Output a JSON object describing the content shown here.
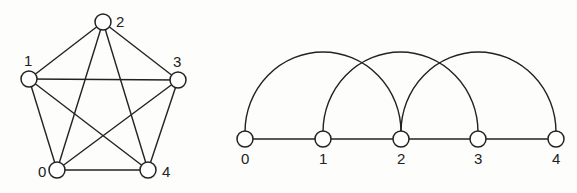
{
  "left_graph": {
    "name": "complete-graph-k5",
    "nodes": [
      {
        "id": "0",
        "label": "0",
        "x": 57,
        "y": 170,
        "lx": 38,
        "ly": 177
      },
      {
        "id": "1",
        "label": "1",
        "x": 29,
        "y": 79,
        "lx": 24,
        "ly": 66
      },
      {
        "id": "2",
        "label": "2",
        "x": 103,
        "y": 22,
        "lx": 116,
        "ly": 27
      },
      {
        "id": "3",
        "label": "3",
        "x": 178,
        "y": 80,
        "lx": 173,
        "ly": 67
      },
      {
        "id": "4",
        "label": "4",
        "x": 148,
        "y": 170,
        "lx": 162,
        "ly": 177
      }
    ],
    "edges": [
      [
        "0",
        "1"
      ],
      [
        "0",
        "2"
      ],
      [
        "0",
        "3"
      ],
      [
        "0",
        "4"
      ],
      [
        "1",
        "2"
      ],
      [
        "1",
        "3"
      ],
      [
        "1",
        "4"
      ],
      [
        "2",
        "3"
      ],
      [
        "2",
        "4"
      ],
      [
        "3",
        "4"
      ]
    ]
  },
  "right_graph": {
    "name": "linear-arc-layout",
    "nodes": [
      {
        "id": "0",
        "label": "0",
        "x": 245,
        "y": 139
      },
      {
        "id": "1",
        "label": "1",
        "x": 323,
        "y": 139
      },
      {
        "id": "2",
        "label": "2",
        "x": 401,
        "y": 139
      },
      {
        "id": "3",
        "label": "3",
        "x": 478,
        "y": 139
      },
      {
        "id": "4",
        "label": "4",
        "x": 556,
        "y": 139
      }
    ],
    "line_edges": [
      [
        "0",
        "1"
      ],
      [
        "1",
        "2"
      ],
      [
        "2",
        "3"
      ],
      [
        "3",
        "4"
      ]
    ],
    "arc_edges": [
      [
        "0",
        "2"
      ],
      [
        "1",
        "3"
      ],
      [
        "2",
        "4"
      ]
    ]
  }
}
